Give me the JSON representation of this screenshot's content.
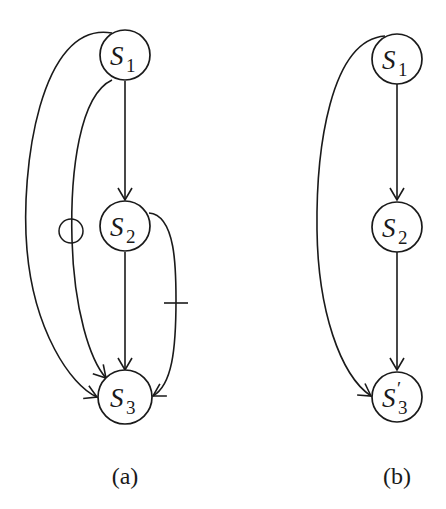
{
  "figure": {
    "panels": [
      {
        "id": "a",
        "caption": "(a)",
        "nodes": [
          {
            "id": "S1",
            "letter": "S",
            "subscript": "1",
            "prime": ""
          },
          {
            "id": "S2",
            "letter": "S",
            "subscript": "2",
            "prime": ""
          },
          {
            "id": "S3",
            "letter": "S",
            "subscript": "3",
            "prime": ""
          }
        ],
        "edges": [
          {
            "from": "S1",
            "to": "S2",
            "style": "straight",
            "marker": "none"
          },
          {
            "from": "S2",
            "to": "S3",
            "style": "straight",
            "marker": "none"
          },
          {
            "from": "S1",
            "to": "S3",
            "style": "curve-outer-left",
            "marker": "none"
          },
          {
            "from": "S1",
            "to": "S3",
            "style": "curve-inner-left",
            "marker": "circle"
          },
          {
            "from": "S2",
            "to": "S3",
            "style": "curve-right",
            "marker": "tick"
          }
        ]
      },
      {
        "id": "b",
        "caption": "(b)",
        "nodes": [
          {
            "id": "S1",
            "letter": "S",
            "subscript": "1",
            "prime": ""
          },
          {
            "id": "S2",
            "letter": "S",
            "subscript": "2",
            "prime": ""
          },
          {
            "id": "S3p",
            "letter": "S",
            "subscript": "3",
            "prime": "′"
          }
        ],
        "edges": [
          {
            "from": "S1",
            "to": "S2",
            "style": "straight",
            "marker": "none"
          },
          {
            "from": "S2",
            "to": "S3p",
            "style": "straight",
            "marker": "none"
          },
          {
            "from": "S1",
            "to": "S3p",
            "style": "curve-outer-left",
            "marker": "none"
          }
        ]
      }
    ]
  }
}
